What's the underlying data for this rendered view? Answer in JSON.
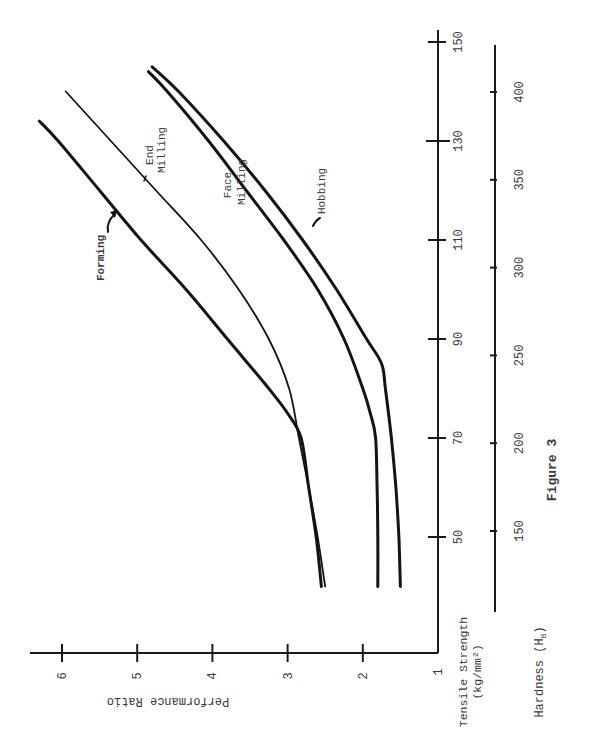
{
  "chart_data": {
    "type": "line",
    "title": "Figure 3",
    "orientation": "rotated 90° clockwise (x-axis vertical, y-axis horizontal)",
    "xlabel": "Tensile Strength (kg/mm²)",
    "xlabel_line1": "Tensile Strength",
    "xlabel_line2": "(kg/mm²)",
    "x2label": "Hardness (H_B)",
    "x2label_text": "Hardness (H",
    "x2label_sub": "B",
    "ylabel": "Performance Ratio",
    "xlim": [
      40,
      150
    ],
    "ylim": [
      1,
      6.3
    ],
    "x_ticks": [
      50,
      70,
      90,
      110,
      130,
      150
    ],
    "x2_ticks": [
      150,
      200,
      250,
      300,
      350,
      400
    ],
    "y_ticks": [
      1,
      2,
      3,
      4,
      5,
      6
    ],
    "grid": false,
    "legend": "inline labels",
    "series": [
      {
        "name": "Forming",
        "x": [
          40,
          50,
          60,
          70,
          75,
          80,
          90,
          100,
          110,
          120,
          130,
          134
        ],
        "values": [
          2.55,
          2.62,
          2.72,
          2.82,
          3.0,
          3.25,
          3.8,
          4.35,
          4.95,
          5.5,
          6.05,
          6.3
        ]
      },
      {
        "name": "End Milling",
        "x": [
          40,
          50,
          60,
          70,
          80,
          90,
          100,
          110,
          120,
          130,
          140
        ],
        "values": [
          2.5,
          2.6,
          2.72,
          2.85,
          2.98,
          3.25,
          3.65,
          4.15,
          4.75,
          5.35,
          5.95
        ]
      },
      {
        "name": "Face Milling",
        "x": [
          40,
          50,
          60,
          70,
          75,
          80,
          90,
          100,
          110,
          120,
          130,
          140,
          144
        ],
        "values": [
          1.8,
          1.8,
          1.81,
          1.83,
          1.9,
          2.0,
          2.25,
          2.6,
          3.05,
          3.55,
          4.05,
          4.6,
          4.85
        ]
      },
      {
        "name": "Hobbing",
        "x": [
          40,
          50,
          60,
          70,
          80,
          85,
          90,
          100,
          110,
          120,
          130,
          140,
          145
        ],
        "values": [
          1.5,
          1.52,
          1.56,
          1.62,
          1.7,
          1.75,
          1.95,
          2.35,
          2.8,
          3.3,
          3.85,
          4.45,
          4.8
        ]
      }
    ]
  }
}
